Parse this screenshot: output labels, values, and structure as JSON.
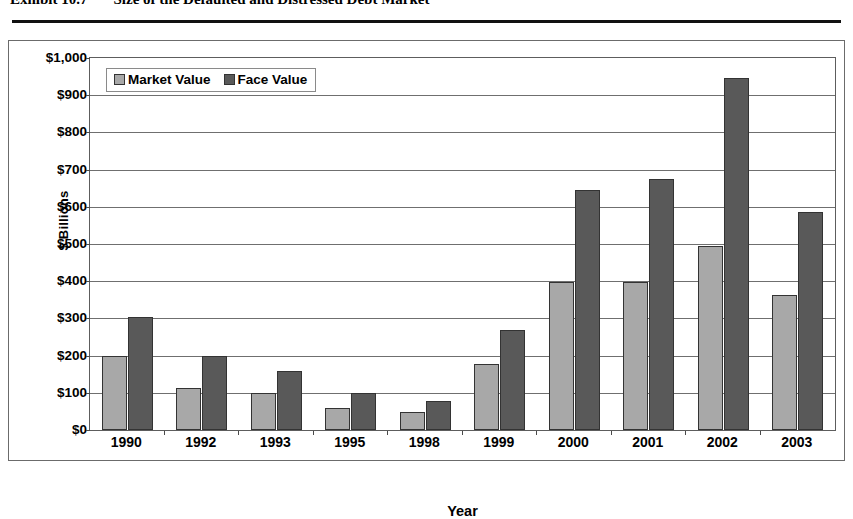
{
  "exhibit": {
    "label": "Exhibit 10.7",
    "title": "Size of the Defaulted and Distressed Debt Market"
  },
  "chart_data": {
    "type": "bar",
    "title": "Size of the Defaulted and Distressed Debt Market",
    "xlabel": "Year",
    "ylabel": "$ Billions",
    "ylim": [
      0,
      1000
    ],
    "ytick_step": 100,
    "ytick_labels": [
      "$0",
      "$100",
      "$200",
      "$300",
      "$400",
      "$500",
      "$600",
      "$700",
      "$800",
      "$900",
      "$1,000"
    ],
    "ytick_values": [
      0,
      100,
      200,
      300,
      400,
      500,
      600,
      700,
      800,
      900,
      1000
    ],
    "grid": true,
    "legend_position": "top-left-inside",
    "categories": [
      "1990",
      "1992",
      "1993",
      "1995",
      "1998",
      "1999",
      "2000",
      "2001",
      "2002",
      "2003"
    ],
    "series": [
      {
        "name": "Market Value",
        "color": "#a8a8a8",
        "values": [
          200,
          112,
          100,
          60,
          48,
          178,
          398,
          398,
          495,
          363
        ]
      },
      {
        "name": "Face Value",
        "color": "#595959",
        "values": [
          303,
          200,
          158,
          100,
          78,
          268,
          645,
          675,
          945,
          585
        ]
      }
    ]
  }
}
